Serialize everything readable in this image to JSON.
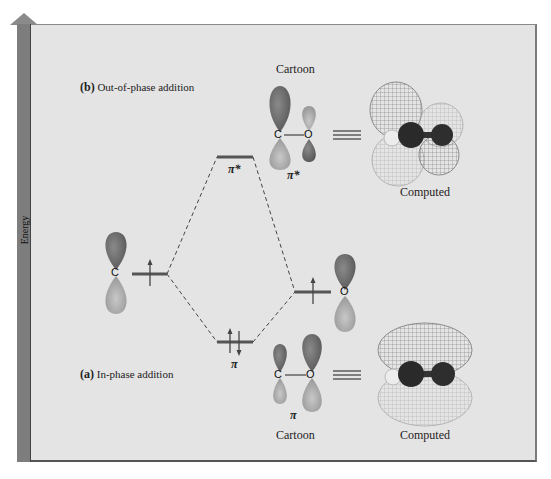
{
  "axis": {
    "label": "Energy"
  },
  "sections": {
    "b": {
      "letter": "(b)",
      "title": "Out-of-phase addition"
    },
    "a": {
      "letter": "(a)",
      "title": "In-phase addition"
    }
  },
  "atoms": {
    "left": "C",
    "right": "O"
  },
  "levels": {
    "pi_star": {
      "label": "π*",
      "electrons": 0
    },
    "pi": {
      "label": "π",
      "electrons": 2
    },
    "carbon_p": {
      "electrons": 1
    },
    "oxygen_p": {
      "electrons": 1
    }
  },
  "panels": {
    "top_cartoon_title": "Cartoon",
    "top_cartoon_caption": "π*",
    "top_computed_caption": "Computed",
    "bottom_cartoon_caption": "π",
    "bottom_cartoon_title": "Cartoon",
    "bottom_computed_caption": "Computed",
    "cartoon_atoms": {
      "c": "C",
      "o": "O"
    }
  },
  "colors": {
    "lobe_dark": "#6e6e6e",
    "lobe_light": "#b5b5b5",
    "level_line": "#555555",
    "frame_bg": "#e4e4e4"
  }
}
